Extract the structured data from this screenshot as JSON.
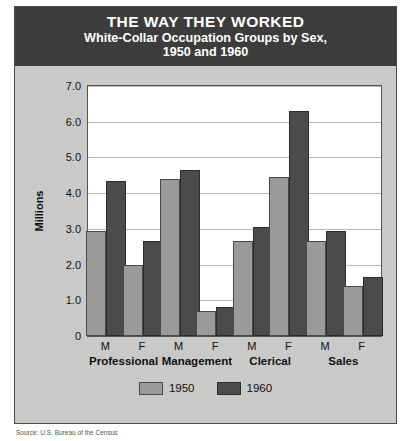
{
  "poster": {
    "main_title": "THE WAY THEY WORKED",
    "sub_title_line1": "White-Collar Occupation Groups by Sex,",
    "sub_title_line2": "1950 and 1960",
    "source_note": "Source: U.S. Bureau of the Census"
  },
  "colors": {
    "title_band": "#3c3c3c",
    "poster_background": "#c9c9c7",
    "plot_background": "#ffffff",
    "series_1950": "#9a9a9a",
    "series_1960": "#4b4b4b",
    "gridline": "#b9b9b9"
  },
  "legend": {
    "items": [
      {
        "label": "1950",
        "swatch": "y1950"
      },
      {
        "label": "1960",
        "swatch": "y1960"
      }
    ]
  },
  "axis": {
    "y_title": "Millions",
    "y_ticks": [
      "7.0",
      "6.0",
      "5.0",
      "4.0",
      "3.0",
      "2.0",
      "1.0",
      "0"
    ],
    "sex_labels": [
      "M",
      "F",
      "M",
      "F",
      "M",
      "F",
      "M",
      "F"
    ],
    "group_labels": [
      "Professional",
      "Management",
      "Clerical",
      "Sales"
    ]
  },
  "chart_data": {
    "type": "bar",
    "title": "THE WAY THEY WORKED",
    "subtitle": "White-Collar Occupation Groups by Sex, 1950 and 1960",
    "xlabel": "",
    "ylabel": "Millions",
    "ylim": [
      0,
      7.0
    ],
    "ytick_values": [
      0,
      1.0,
      2.0,
      3.0,
      4.0,
      5.0,
      6.0,
      7.0
    ],
    "grid": true,
    "legend_position": "bottom",
    "categories": [
      "Professional M",
      "Professional F",
      "Management M",
      "Management F",
      "Clerical M",
      "Clerical F",
      "Sales M",
      "Sales F"
    ],
    "groups": [
      "Professional",
      "Management",
      "Clerical",
      "Sales"
    ],
    "sexes": [
      "M",
      "F"
    ],
    "series": [
      {
        "name": "1950",
        "color": "#9a9a9a",
        "values": [
          2.95,
          2.0,
          4.4,
          0.7,
          2.65,
          4.45,
          2.65,
          1.4
        ]
      },
      {
        "name": "1960",
        "color": "#4b4b4b",
        "values": [
          4.35,
          2.65,
          4.65,
          0.8,
          3.05,
          6.3,
          2.95,
          1.65
        ]
      }
    ]
  }
}
